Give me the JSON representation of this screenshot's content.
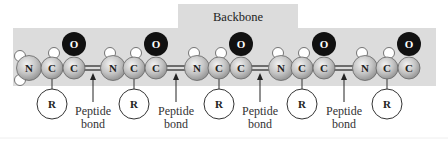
{
  "title": "Backbone",
  "colors": {
    "band": "#dcdcdc",
    "atom_fill": "#bdbdbd",
    "atom_stroke": "#555555",
    "oxygen": "#111111",
    "hydrogen": "#ffffff",
    "line": "#222222"
  },
  "residues": [
    {
      "n": "N",
      "ca": "C",
      "c": "C",
      "o": "O",
      "r": "R"
    },
    {
      "n": "N",
      "ca": "C",
      "c": "C",
      "o": "O",
      "r": "R"
    },
    {
      "n": "N",
      "ca": "C",
      "c": "C",
      "o": "O",
      "r": "R"
    },
    {
      "n": "N",
      "ca": "C",
      "c": "C",
      "o": "O",
      "r": "R"
    },
    {
      "n": "N",
      "ca": "C",
      "c": "C",
      "o": "O",
      "r": "R"
    }
  ],
  "bonds": [
    {
      "line1": "Peptide",
      "line2": "bond"
    },
    {
      "line1": "Peptide",
      "line2": "bond"
    },
    {
      "line1": "Peptide",
      "line2": "bond"
    },
    {
      "line1": "Peptide",
      "line2": "bond"
    }
  ]
}
